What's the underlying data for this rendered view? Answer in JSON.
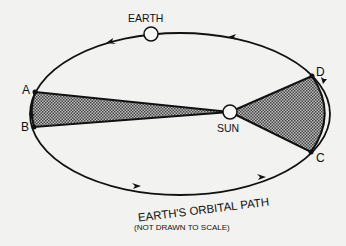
{
  "diagram": {
    "labels": {
      "earth": "EARTH",
      "sun": "SUN",
      "point_a": "A",
      "point_b": "B",
      "point_c": "C",
      "point_d": "D",
      "orbit": "EARTH'S ORBITAL PATH",
      "note": "(NOT DRAWN TO SCALE)"
    },
    "colors": {
      "background": "#f2f2f0",
      "line": "#111111",
      "shaded": "#8a8a8a"
    },
    "shaded_regions": [
      {
        "name": "sector-ab",
        "from": "A",
        "to": "B"
      },
      {
        "name": "sector-cd",
        "from": "C",
        "to": "D"
      }
    ]
  }
}
